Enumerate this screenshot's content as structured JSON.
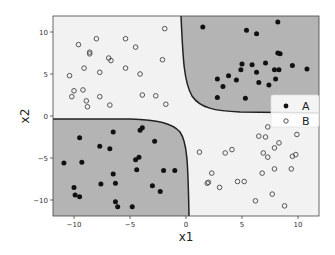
{
  "chart_data": {
    "type": "scatter",
    "title": "",
    "xlabel": "x1",
    "ylabel": "x2",
    "xlim": [
      -12,
      12
    ],
    "ylim": [
      -12,
      12
    ],
    "xticks": [
      -10,
      -5,
      0,
      5,
      10
    ],
    "yticks": [
      -10,
      -5,
      0,
      5,
      10
    ],
    "xtick_labels": [
      "−10",
      "−5",
      "0",
      "5",
      "10"
    ],
    "ytick_labels": [
      "−10",
      "−5",
      "0",
      "5",
      "10"
    ],
    "grid": false,
    "legend_position": "right-center",
    "regions": {
      "class_A_fill": "#b4b4b4",
      "class_B_fill": "#f2f2f2",
      "boundary_color": "#222222",
      "description": "Decision boundary (hyperbola-like, x1*x2 = 0 pattern): class A predicted in quadrants x1>0,x2>0 and x1<0,x2<0"
    },
    "series": [
      {
        "name": "A",
        "marker": "filled-circle",
        "color": "#111111",
        "points": [
          [
            1.5,
            10.6
          ],
          [
            8.2,
            11.2
          ],
          [
            5.4,
            10.2
          ],
          [
            6.3,
            9.8
          ],
          [
            8.2,
            7.5
          ],
          [
            8.4,
            7.4
          ],
          [
            5.0,
            6.2
          ],
          [
            5.9,
            6.1
          ],
          [
            7.1,
            6.3
          ],
          [
            4.9,
            5.5
          ],
          [
            6.3,
            5.2
          ],
          [
            7.9,
            5.5
          ],
          [
            8.3,
            5.5
          ],
          [
            9.5,
            6.0
          ],
          [
            10.8,
            5.6
          ],
          [
            2.8,
            4.4
          ],
          [
            3.8,
            4.8
          ],
          [
            4.5,
            4.3
          ],
          [
            3.3,
            3.5
          ],
          [
            6.5,
            4.0
          ],
          [
            8.0,
            4.4
          ],
          [
            7.4,
            3.7
          ],
          [
            2.8,
            2.2
          ],
          [
            5.3,
            2.1
          ],
          [
            -6.5,
            -1.9
          ],
          [
            -4.1,
            -1.7
          ],
          [
            -3.9,
            -1.4
          ],
          [
            -9.5,
            -2.6
          ],
          [
            -7.7,
            -3.6
          ],
          [
            -6.8,
            -3.9
          ],
          [
            -2.8,
            -3.0
          ],
          [
            -10.9,
            -5.6
          ],
          [
            -9.3,
            -5.5
          ],
          [
            -4.5,
            -5.2
          ],
          [
            -4.2,
            -4.9
          ],
          [
            -4.4,
            -6.4
          ],
          [
            -6.5,
            -6.9
          ],
          [
            -2.0,
            -6.5
          ],
          [
            -1.0,
            -6.5
          ],
          [
            -7.6,
            -8.1
          ],
          [
            -6.3,
            -8.0
          ],
          [
            -3.0,
            -8.3
          ],
          [
            -2.3,
            -9.0
          ],
          [
            -10.0,
            -8.5
          ],
          [
            -9.9,
            -9.4
          ],
          [
            -9.5,
            -9.6
          ],
          [
            -6.3,
            -10.2
          ],
          [
            -6.1,
            -10.8
          ],
          [
            -4.8,
            -10.8
          ]
        ]
      },
      {
        "name": "B",
        "marker": "hollow-circle",
        "color": "#555555",
        "points": [
          [
            -1.9,
            10.4
          ],
          [
            -8.0,
            9.2
          ],
          [
            -5.4,
            9.2
          ],
          [
            -9.6,
            8.5
          ],
          [
            -4.5,
            8.2
          ],
          [
            -8.6,
            7.6
          ],
          [
            -8.6,
            7.4
          ],
          [
            -6.9,
            6.9
          ],
          [
            -6.7,
            6.6
          ],
          [
            -2.1,
            6.7
          ],
          [
            -9.1,
            5.7
          ],
          [
            -5.4,
            5.7
          ],
          [
            -7.7,
            5.2
          ],
          [
            -10.4,
            4.8
          ],
          [
            -4.1,
            5.0
          ],
          [
            -10.0,
            3.0
          ],
          [
            -9.2,
            3.1
          ],
          [
            -10.2,
            2.3
          ],
          [
            -7.7,
            2.3
          ],
          [
            -8.9,
            1.8
          ],
          [
            -8.8,
            1.1
          ],
          [
            -6.8,
            1.3
          ],
          [
            -3.9,
            2.5
          ],
          [
            -2.7,
            2.4
          ],
          [
            -1.8,
            1.4
          ],
          [
            7.3,
            -1.3
          ],
          [
            6.5,
            -2.4
          ],
          [
            7.1,
            -2.5
          ],
          [
            9.9,
            -2.2
          ],
          [
            8.3,
            -3.2
          ],
          [
            7.9,
            -3.8
          ],
          [
            1.2,
            -4.3
          ],
          [
            3.5,
            -4.4
          ],
          [
            4.1,
            -4.0
          ],
          [
            6.9,
            -4.4
          ],
          [
            7.3,
            -4.9
          ],
          [
            9.5,
            -4.8
          ],
          [
            9.8,
            -4.6
          ],
          [
            2.3,
            -6.8
          ],
          [
            6.8,
            -6.8
          ],
          [
            7.9,
            -6.3
          ],
          [
            9.4,
            -6.3
          ],
          [
            1.9,
            -8.0
          ],
          [
            2.0,
            -7.9
          ],
          [
            3.0,
            -8.5
          ],
          [
            4.6,
            -7.8
          ],
          [
            5.2,
            -7.8
          ],
          [
            7.7,
            -9.3
          ],
          [
            6.2,
            -10.1
          ],
          [
            8.8,
            -10.7
          ]
        ]
      }
    ]
  },
  "legend": {
    "items": [
      {
        "label": "A",
        "marker": "filled-circle"
      },
      {
        "label": "B",
        "marker": "hollow-circle"
      }
    ]
  }
}
